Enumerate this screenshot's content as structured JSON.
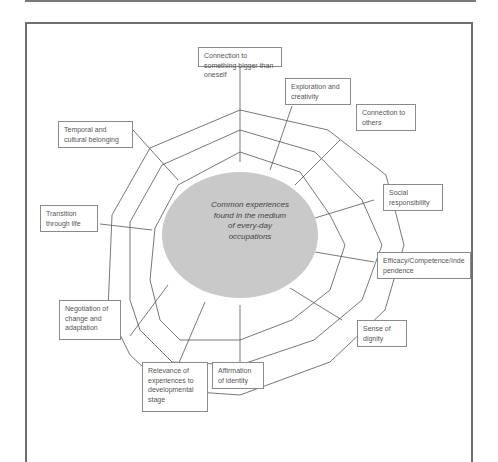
{
  "diagram": {
    "center": {
      "text": "Common experiences found in the medium of every-day occupations",
      "lines": [
        "Common experiences",
        "found in the medium",
        "of every-day",
        "occupations"
      ],
      "fill": "#c9c9c9"
    },
    "labels": [
      {
        "id": "connection-bigger",
        "text": "Connection to something bigger than oneself"
      },
      {
        "id": "exploration",
        "text": "Exploration and creativity"
      },
      {
        "id": "connection-others",
        "text": "Connection to others"
      },
      {
        "id": "social-responsibility",
        "text": "Social responsibility"
      },
      {
        "id": "efficacy",
        "text": "Efficacy/Competence/Independence"
      },
      {
        "id": "dignity",
        "text": "Sense of dignity"
      },
      {
        "id": "identity",
        "text": "Affirmation of identity"
      },
      {
        "id": "relevance",
        "text": "Relevance of experiences to developmental stage"
      },
      {
        "id": "negotiation",
        "text": "Negotiation of change and adaptation"
      },
      {
        "id": "transition",
        "text": "Transition through life"
      },
      {
        "id": "temporal",
        "text": "Temporal and cultural belonging"
      }
    ],
    "colors": {
      "line": "#555555",
      "frame": "#6e6e6e",
      "box_border": "#8a8a8a"
    }
  }
}
